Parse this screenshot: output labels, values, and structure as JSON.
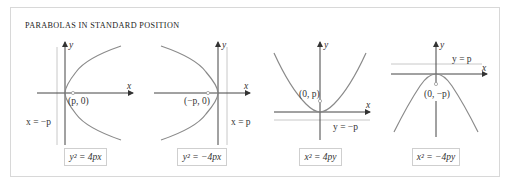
{
  "title": "PARABOLAS IN STANDARD POSITION",
  "colors": {
    "frame_border": "#d8d8d8",
    "axis": "#444444",
    "curve": "#8a8a8a",
    "directrix": "#c8c8c8",
    "focus": "#9a9a9a",
    "equation_border": "#cfcfcf"
  },
  "panels": [
    {
      "id": "right-opening",
      "equation": "y² = 4px",
      "axis_x_label": "x",
      "axis_y_label": "y",
      "focus_label": "(p, 0)",
      "directrix_label": "x = −p",
      "opens": "right"
    },
    {
      "id": "left-opening",
      "equation": "y² = −4px",
      "axis_x_label": "x",
      "axis_y_label": "y",
      "focus_label": "(−p, 0)",
      "directrix_label": "x = p",
      "opens": "left"
    },
    {
      "id": "up-opening",
      "equation": "x² = 4py",
      "axis_x_label": "x",
      "axis_y_label": "y",
      "focus_label": "(0, p)",
      "directrix_label": "y = −p",
      "opens": "up"
    },
    {
      "id": "down-opening",
      "equation": "x² = −4py",
      "axis_x_label": "x",
      "axis_y_label": "y",
      "focus_label": "(0, −p)",
      "directrix_label": "y = p",
      "opens": "down"
    }
  ]
}
